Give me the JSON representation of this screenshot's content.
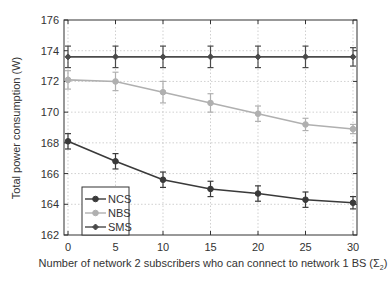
{
  "chart_data": {
    "type": "line",
    "title": "",
    "xlabel": "Number of network 2 subscribers who can connect to network 1 BS (Σ",
    "xlabel_subscript": "2",
    "xlabel_suffix": ")",
    "ylabel": "Total power consumption (W)",
    "x": [
      0,
      5,
      10,
      15,
      20,
      25,
      30
    ],
    "xticks": [
      0,
      5,
      10,
      15,
      20,
      25,
      30
    ],
    "yticks": [
      162,
      164,
      166,
      168,
      170,
      172,
      174,
      176
    ],
    "xlim": [
      0,
      30
    ],
    "ylim": [
      162,
      176
    ],
    "grid": true,
    "legend_position": "lower left",
    "series": [
      {
        "name": "NCS",
        "color": "#3a3a3a",
        "marker": "circle",
        "values": [
          168.1,
          166.8,
          165.6,
          165.0,
          164.7,
          164.3,
          164.1
        ],
        "error": [
          0.5,
          0.5,
          0.5,
          0.5,
          0.5,
          0.5,
          0.4
        ]
      },
      {
        "name": "NBS",
        "color": "#b0b0b0",
        "marker": "circle",
        "values": [
          172.1,
          172.0,
          171.3,
          170.6,
          169.9,
          169.2,
          168.9
        ],
        "error": [
          0.6,
          0.6,
          0.7,
          0.6,
          0.5,
          0.4,
          0.3
        ]
      },
      {
        "name": "SMS",
        "color": "#4a4a4a",
        "marker": "diamond",
        "values": [
          173.6,
          173.6,
          173.6,
          173.6,
          173.6,
          173.6,
          173.6
        ],
        "error": [
          0.7,
          0.7,
          0.7,
          0.7,
          0.7,
          0.7,
          0.6
        ]
      }
    ]
  }
}
